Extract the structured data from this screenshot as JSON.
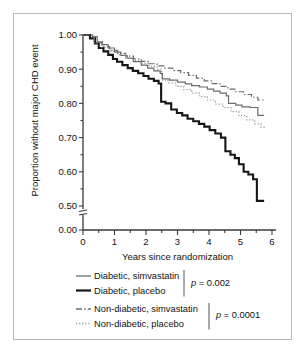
{
  "figure": {
    "border_color": "#b9b9b9",
    "background": "#ffffff"
  },
  "chart_data": {
    "type": "line",
    "subtype": "kaplan-meier-step",
    "title": "",
    "xlabel": "Years since randomization",
    "ylabel": "Proportion without major CHD event",
    "xlim": [
      0,
      6
    ],
    "ylim": [
      0.5,
      1.0
    ],
    "y_axis_break": true,
    "y_break_note": "axis break between 0.50 and 0.00",
    "grid": false,
    "legend_position": "below",
    "xticks": [
      0,
      1,
      2,
      3,
      4,
      5,
      6
    ],
    "xtick_labels": [
      "0",
      "1",
      "2",
      "3",
      "4",
      "5",
      "6"
    ],
    "xminor_ticks": [
      0.5,
      1.5,
      2.5,
      3.5,
      4.5,
      5.5
    ],
    "yticks": [
      1.0,
      0.9,
      0.8,
      0.7,
      0.6,
      0.5,
      0.0
    ],
    "ytick_labels": [
      "1.00",
      "0.90",
      "0.80",
      "0.70",
      "0.60",
      "0.50",
      "0.00"
    ],
    "yminor_ticks": [
      0.95,
      0.85,
      0.75,
      0.65,
      0.55
    ],
    "series": [
      {
        "name": "Diabetic, simvastatin",
        "color": "#6b6b6b",
        "style": "solid",
        "width": 1.2,
        "end_value": 0.765,
        "x": [
          0,
          0.3,
          0.45,
          0.62,
          0.8,
          1.0,
          1.2,
          1.4,
          1.6,
          1.85,
          2.05,
          2.25,
          2.45,
          2.52,
          2.75,
          3.0,
          3.25,
          3.45,
          3.7,
          3.95,
          4.15,
          4.35,
          4.55,
          4.62,
          4.85,
          5.05,
          5.3,
          5.45,
          5.55,
          5.75
        ],
        "y": [
          1.0,
          0.995,
          0.98,
          0.972,
          0.962,
          0.95,
          0.94,
          0.932,
          0.922,
          0.912,
          0.903,
          0.895,
          0.888,
          0.872,
          0.868,
          0.862,
          0.857,
          0.852,
          0.848,
          0.842,
          0.836,
          0.83,
          0.822,
          0.8,
          0.795,
          0.79,
          0.788,
          0.788,
          0.765,
          0.765
        ]
      },
      {
        "name": "Diabetic, placebo",
        "color": "#161616",
        "style": "solid",
        "width": 2.1,
        "end_value": 0.515,
        "x": [
          0,
          0.22,
          0.38,
          0.5,
          0.65,
          0.8,
          0.95,
          1.08,
          1.25,
          1.42,
          1.58,
          1.75,
          1.92,
          2.08,
          2.25,
          2.4,
          2.48,
          2.62,
          2.8,
          2.98,
          3.15,
          3.32,
          3.5,
          3.68,
          3.85,
          4.02,
          4.2,
          4.38,
          4.52,
          4.68,
          4.82,
          4.95,
          5.1,
          5.25,
          5.4,
          5.52,
          5.75
        ],
        "y": [
          1.0,
          0.99,
          0.975,
          0.962,
          0.952,
          0.942,
          0.93,
          0.922,
          0.912,
          0.903,
          0.895,
          0.888,
          0.88,
          0.872,
          0.866,
          0.858,
          0.805,
          0.8,
          0.782,
          0.772,
          0.765,
          0.755,
          0.748,
          0.74,
          0.732,
          0.722,
          0.712,
          0.7,
          0.66,
          0.65,
          0.64,
          0.622,
          0.6,
          0.592,
          0.578,
          0.515,
          0.515
        ]
      },
      {
        "name": "Non-diabetic, simvastatin",
        "color": "#6b6b6b",
        "style": "dashdot",
        "width": 1.2,
        "end_value": 0.808,
        "x": [
          0,
          0.35,
          0.6,
          0.85,
          1.1,
          1.35,
          1.6,
          1.85,
          2.1,
          2.35,
          2.6,
          2.85,
          3.1,
          3.35,
          3.6,
          3.85,
          4.1,
          4.35,
          4.6,
          4.85,
          5.1,
          5.35,
          5.55,
          5.75
        ],
        "y": [
          1.0,
          0.978,
          0.966,
          0.955,
          0.946,
          0.938,
          0.93,
          0.923,
          0.916,
          0.91,
          0.903,
          0.896,
          0.89,
          0.882,
          0.874,
          0.866,
          0.858,
          0.85,
          0.842,
          0.834,
          0.826,
          0.818,
          0.81,
          0.808
        ]
      },
      {
        "name": "Non-diabetic, placebo",
        "color": "#8e8e8e",
        "style": "dotted",
        "width": 1.2,
        "end_value": 0.728,
        "x": [
          0,
          0.35,
          0.6,
          0.85,
          1.1,
          1.35,
          1.6,
          1.85,
          2.1,
          2.35,
          2.5,
          2.7,
          2.95,
          3.2,
          3.45,
          3.7,
          3.95,
          4.2,
          4.45,
          4.7,
          4.95,
          5.2,
          5.45,
          5.65,
          5.75
        ],
        "y": [
          1.0,
          0.976,
          0.963,
          0.952,
          0.942,
          0.933,
          0.925,
          0.917,
          0.908,
          0.9,
          0.868,
          0.86,
          0.85,
          0.84,
          0.83,
          0.82,
          0.81,
          0.798,
          0.788,
          0.776,
          0.764,
          0.752,
          0.74,
          0.73,
          0.728
        ]
      }
    ],
    "annotations": [
      {
        "text": "p = 0.002",
        "refers_to": [
          "Diabetic, simvastatin",
          "Diabetic, placebo"
        ]
      },
      {
        "text": "p = 0.0001",
        "refers_to": [
          "Non-diabetic, simvastatin",
          "Non-diabetic, placebo"
        ]
      }
    ]
  },
  "legend": {
    "entries": [
      {
        "label": "Diabetic, simvastatin",
        "style": "solid",
        "color": "#6b6b6b",
        "width": 1.3
      },
      {
        "label": "Diabetic, placebo",
        "style": "solid",
        "color": "#161616",
        "width": 2.2
      },
      {
        "label": "Non-diabetic, simvastatin",
        "style": "dashdot",
        "color": "#6b6b6b",
        "width": 1.3
      },
      {
        "label": "Non-diabetic, placebo",
        "style": "dotted",
        "color": "#8e8e8e",
        "width": 1.3
      }
    ],
    "pvalues": [
      {
        "prefix": "p",
        "rest": " = 0.002"
      },
      {
        "prefix": "p",
        "rest": " = 0.0001"
      }
    ]
  }
}
